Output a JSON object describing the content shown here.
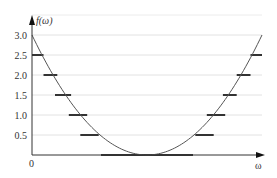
{
  "chart_data": {
    "type": "line",
    "title": "",
    "xlabel": "ω",
    "ylabel": "f(ω)",
    "x_origin_label": "0",
    "yticks": [
      {
        "value": 0.5,
        "label": "0.5"
      },
      {
        "value": 1.0,
        "label": "1.0"
      },
      {
        "value": 1.5,
        "label": "1.5"
      },
      {
        "value": 2.0,
        "label": "2.0"
      },
      {
        "value": 2.5,
        "label": "2.5"
      },
      {
        "value": 3.0,
        "label": "3.0"
      }
    ],
    "ylim": [
      0,
      3.4
    ],
    "xlim": [
      0,
      1.0
    ],
    "grid": true,
    "curve": {
      "name": "f(ω)",
      "description": "parabola with minimum at centre",
      "x_min": 0.0,
      "x_max": 1.0,
      "vertex_x": 0.5,
      "vertex_y": 0.0,
      "y_at_ends": 3.0
    },
    "level_segments": [
      {
        "level": 0.0,
        "x_start": 0.3,
        "x_end": 0.7
      },
      {
        "level": 0.5,
        "x_start": 0.21,
        "x_end": 0.29
      },
      {
        "level": 0.5,
        "x_start": 0.71,
        "x_end": 0.79
      },
      {
        "level": 1.0,
        "x_start": 0.16,
        "x_end": 0.24
      },
      {
        "level": 1.0,
        "x_start": 0.76,
        "x_end": 0.84
      },
      {
        "level": 1.5,
        "x_start": 0.1,
        "x_end": 0.17
      },
      {
        "level": 1.5,
        "x_start": 0.83,
        "x_end": 0.89
      },
      {
        "level": 2.0,
        "x_start": 0.05,
        "x_end": 0.11
      },
      {
        "level": 2.0,
        "x_start": 0.89,
        "x_end": 0.95
      },
      {
        "level": 2.5,
        "x_start": 0.0,
        "x_end": 0.05
      },
      {
        "level": 2.5,
        "x_start": 0.95,
        "x_end": 1.0
      }
    ]
  }
}
